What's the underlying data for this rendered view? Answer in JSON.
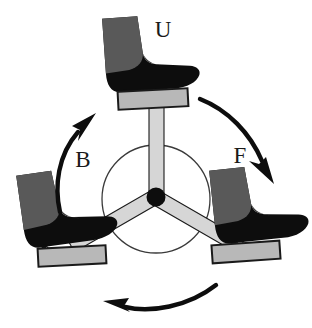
{
  "figure": {
    "background_color": "#ffffff"
  },
  "labels": {
    "up": "U",
    "back": "B",
    "front": "F"
  },
  "colors": {
    "boot_dark": "#0d0d0d",
    "boot_shaft_gray": "#595959",
    "pedal_gray": "#b8b8b8",
    "spoke_gray": "#d6d6d6",
    "outline": "#1a1a1a",
    "hub_black": "#0d0d0d",
    "background": "#ffffff"
  },
  "hub": {
    "center_x": 156,
    "center_y": 197,
    "radius": 9,
    "circle_radius": 54
  },
  "spokes": [
    {
      "name": "spoke-up",
      "angle_deg": 90,
      "label": "U"
    },
    {
      "name": "spoke-lower-left",
      "angle_deg": 210,
      "label": "B"
    },
    {
      "name": "spoke-lower-right",
      "angle_deg": 330,
      "label": "F"
    }
  ],
  "boots": [
    {
      "name": "boot-top",
      "position": "top",
      "facing": "right",
      "rotation_deg": -4
    },
    {
      "name": "boot-left",
      "position": "lower-left",
      "facing": "right",
      "rotation_deg": -9
    },
    {
      "name": "boot-right",
      "position": "lower-right",
      "facing": "right",
      "rotation_deg": -6
    }
  ],
  "pedals": [
    {
      "name": "pedal-top",
      "position": "top"
    },
    {
      "name": "pedal-left",
      "position": "lower-left"
    },
    {
      "name": "pedal-right",
      "position": "lower-right"
    }
  ],
  "arrows": [
    {
      "name": "arrow-back",
      "label": "B",
      "direction": "up-right",
      "position": "upper-left"
    },
    {
      "name": "arrow-front",
      "label": "F",
      "direction": "down-right",
      "position": "upper-right"
    },
    {
      "name": "arrow-rotation",
      "label": "",
      "direction": "left",
      "position": "bottom"
    }
  ]
}
